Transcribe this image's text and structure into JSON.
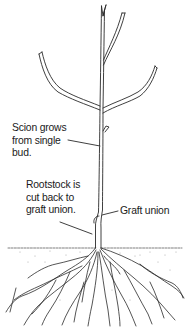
{
  "diagram": {
    "colors": {
      "line": "#2a2a2a",
      "background": "#ffffff",
      "soil_speckle": "#9a9a9a"
    },
    "labels": {
      "scion": {
        "lines": [
          "Scion grows",
          "from single",
          "bud."
        ]
      },
      "rootstock": {
        "lines": [
          "Rootstock is",
          "cut back to",
          "graft union."
        ]
      },
      "graft_union": {
        "lines": [
          "Graft union"
        ]
      }
    },
    "parts": [
      "scion",
      "branches",
      "bud",
      "graft-union",
      "rootstock",
      "ground-line",
      "roots"
    ]
  }
}
